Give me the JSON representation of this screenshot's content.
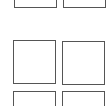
{
  "grid": {
    "border_color": "#555555",
    "background": "#ffffff",
    "tiles": [
      {
        "row": 0,
        "col": 0,
        "x": 14,
        "y": -36,
        "w": 43,
        "h": 44
      },
      {
        "row": 0,
        "col": 1,
        "x": 63,
        "y": -36,
        "w": 43,
        "h": 44
      },
      {
        "row": 1,
        "col": 0,
        "x": 13,
        "y": 40,
        "w": 43,
        "h": 44
      },
      {
        "row": 1,
        "col": 1,
        "x": 62,
        "y": 41,
        "w": 43,
        "h": 44
      },
      {
        "row": 2,
        "col": 0,
        "x": 13,
        "y": 91,
        "w": 43,
        "h": 44
      },
      {
        "row": 2,
        "col": 1,
        "x": 62,
        "y": 91,
        "w": 43,
        "h": 44
      }
    ]
  }
}
